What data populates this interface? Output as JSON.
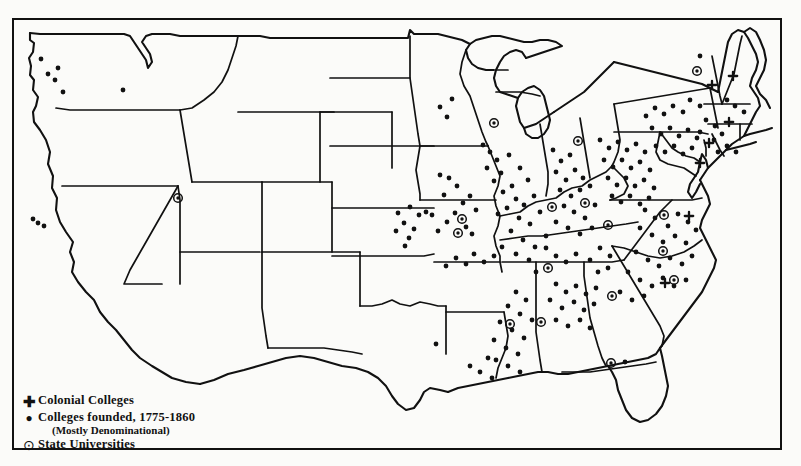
{
  "map": {
    "title": "Colleges and Universities Founded in the United States, 1775-1860",
    "background_color": "#fbfbf9",
    "ink_color": "#111111",
    "frame": true
  },
  "legend": {
    "items": [
      {
        "glyph": "plus-marker-icon",
        "symbol": "✚",
        "label": "Colonial Colleges",
        "sublabel": ""
      },
      {
        "glyph": "dot-marker-icon",
        "symbol": "•",
        "label": "Colleges founded, 1775-1860",
        "sublabel": "(Mostly Denominational)"
      },
      {
        "glyph": "circled-dot-marker-icon",
        "symbol": "⊙",
        "label": "State Universities",
        "sublabel": ""
      }
    ]
  },
  "chart_data": {
    "type": "scatter",
    "xlabel": "",
    "ylabel": "",
    "legend_position": "bottom-left",
    "grid": false,
    "series": [
      {
        "name": "Colonial Colleges",
        "marker": "plus",
        "count": 7,
        "points": [
          {
            "x": 712,
            "y": 85
          },
          {
            "x": 733,
            "y": 76
          },
          {
            "x": 729,
            "y": 122
          },
          {
            "x": 709,
            "y": 143
          },
          {
            "x": 700,
            "y": 163
          },
          {
            "x": 689,
            "y": 216
          },
          {
            "x": 665,
            "y": 283
          }
        ]
      },
      {
        "name": "State Universities",
        "marker": "circled-dot",
        "count": 16,
        "points": [
          {
            "x": 697,
            "y": 71
          },
          {
            "x": 674,
            "y": 280
          },
          {
            "x": 664,
            "y": 215
          },
          {
            "x": 663,
            "y": 251
          },
          {
            "x": 612,
            "y": 296
          },
          {
            "x": 608,
            "y": 225
          },
          {
            "x": 585,
            "y": 203
          },
          {
            "x": 578,
            "y": 141
          },
          {
            "x": 552,
            "y": 207
          },
          {
            "x": 548,
            "y": 268
          },
          {
            "x": 541,
            "y": 322
          },
          {
            "x": 510,
            "y": 324
          },
          {
            "x": 494,
            "y": 123
          },
          {
            "x": 462,
            "y": 219
          },
          {
            "x": 458,
            "y": 233
          },
          {
            "x": 611,
            "y": 363
          },
          {
            "x": 178,
            "y": 198
          }
        ]
      },
      {
        "name": "Colleges founded, 1775-1860 (Mostly Denominational)",
        "marker": "dot",
        "count": 210,
        "points": [
          {
            "x": 41,
            "y": 59
          },
          {
            "x": 48,
            "y": 74
          },
          {
            "x": 55,
            "y": 80
          },
          {
            "x": 58,
            "y": 68
          },
          {
            "x": 63,
            "y": 92
          },
          {
            "x": 123,
            "y": 90
          },
          {
            "x": 38,
            "y": 223
          },
          {
            "x": 44,
            "y": 226
          },
          {
            "x": 33,
            "y": 219
          },
          {
            "x": 440,
            "y": 107
          },
          {
            "x": 447,
            "y": 117
          },
          {
            "x": 452,
            "y": 99
          },
          {
            "x": 440,
            "y": 175
          },
          {
            "x": 449,
            "y": 178
          },
          {
            "x": 457,
            "y": 186
          },
          {
            "x": 444,
            "y": 195
          },
          {
            "x": 463,
            "y": 203
          },
          {
            "x": 470,
            "y": 196
          },
          {
            "x": 476,
            "y": 210
          },
          {
            "x": 455,
            "y": 213
          },
          {
            "x": 447,
            "y": 222
          },
          {
            "x": 466,
            "y": 227
          },
          {
            "x": 438,
            "y": 231
          },
          {
            "x": 472,
            "y": 234
          },
          {
            "x": 398,
            "y": 213
          },
          {
            "x": 404,
            "y": 223
          },
          {
            "x": 410,
            "y": 207
          },
          {
            "x": 396,
            "y": 231
          },
          {
            "x": 414,
            "y": 229
          },
          {
            "x": 405,
            "y": 246
          },
          {
            "x": 419,
            "y": 215
          },
          {
            "x": 409,
            "y": 238
          },
          {
            "x": 426,
            "y": 212
          },
          {
            "x": 432,
            "y": 215
          },
          {
            "x": 483,
            "y": 145
          },
          {
            "x": 490,
            "y": 152
          },
          {
            "x": 497,
            "y": 160
          },
          {
            "x": 487,
            "y": 168
          },
          {
            "x": 501,
            "y": 173
          },
          {
            "x": 509,
            "y": 155
          },
          {
            "x": 494,
            "y": 181
          },
          {
            "x": 512,
            "y": 186
          },
          {
            "x": 503,
            "y": 192
          },
          {
            "x": 520,
            "y": 168
          },
          {
            "x": 528,
            "y": 180
          },
          {
            "x": 516,
            "y": 199
          },
          {
            "x": 524,
            "y": 205
          },
          {
            "x": 534,
            "y": 196
          },
          {
            "x": 507,
            "y": 208
          },
          {
            "x": 498,
            "y": 214
          },
          {
            "x": 519,
            "y": 218
          },
          {
            "x": 530,
            "y": 224
          },
          {
            "x": 540,
            "y": 212
          },
          {
            "x": 511,
            "y": 231
          },
          {
            "x": 523,
            "y": 240
          },
          {
            "x": 535,
            "y": 247
          },
          {
            "x": 546,
            "y": 236
          },
          {
            "x": 502,
            "y": 247
          },
          {
            "x": 516,
            "y": 254
          },
          {
            "x": 529,
            "y": 260
          },
          {
            "x": 553,
            "y": 150
          },
          {
            "x": 561,
            "y": 161
          },
          {
            "x": 570,
            "y": 155
          },
          {
            "x": 556,
            "y": 172
          },
          {
            "x": 566,
            "y": 180
          },
          {
            "x": 575,
            "y": 170
          },
          {
            "x": 583,
            "y": 178
          },
          {
            "x": 560,
            "y": 190
          },
          {
            "x": 571,
            "y": 196
          },
          {
            "x": 580,
            "y": 190
          },
          {
            "x": 590,
            "y": 186
          },
          {
            "x": 564,
            "y": 206
          },
          {
            "x": 574,
            "y": 212
          },
          {
            "x": 585,
            "y": 218
          },
          {
            "x": 595,
            "y": 205
          },
          {
            "x": 556,
            "y": 222
          },
          {
            "x": 568,
            "y": 228
          },
          {
            "x": 580,
            "y": 234
          },
          {
            "x": 592,
            "y": 228
          },
          {
            "x": 600,
            "y": 140
          },
          {
            "x": 609,
            "y": 148
          },
          {
            "x": 618,
            "y": 142
          },
          {
            "x": 627,
            "y": 150
          },
          {
            "x": 636,
            "y": 144
          },
          {
            "x": 645,
            "y": 152
          },
          {
            "x": 604,
            "y": 160
          },
          {
            "x": 613,
            "y": 167
          },
          {
            "x": 622,
            "y": 160
          },
          {
            "x": 631,
            "y": 168
          },
          {
            "x": 640,
            "y": 162
          },
          {
            "x": 650,
            "y": 170
          },
          {
            "x": 608,
            "y": 178
          },
          {
            "x": 617,
            "y": 185
          },
          {
            "x": 626,
            "y": 178
          },
          {
            "x": 635,
            "y": 186
          },
          {
            "x": 644,
            "y": 180
          },
          {
            "x": 654,
            "y": 188
          },
          {
            "x": 612,
            "y": 196
          },
          {
            "x": 621,
            "y": 202
          },
          {
            "x": 630,
            "y": 196
          },
          {
            "x": 640,
            "y": 204
          },
          {
            "x": 649,
            "y": 198
          },
          {
            "x": 652,
            "y": 128
          },
          {
            "x": 661,
            "y": 134
          },
          {
            "x": 670,
            "y": 128
          },
          {
            "x": 679,
            "y": 136
          },
          {
            "x": 688,
            "y": 130
          },
          {
            "x": 697,
            "y": 138
          },
          {
            "x": 656,
            "y": 146
          },
          {
            "x": 665,
            "y": 152
          },
          {
            "x": 674,
            "y": 146
          },
          {
            "x": 683,
            "y": 154
          },
          {
            "x": 692,
            "y": 148
          },
          {
            "x": 706,
            "y": 120
          },
          {
            "x": 715,
            "y": 126
          },
          {
            "x": 700,
            "y": 132
          },
          {
            "x": 714,
            "y": 140
          },
          {
            "x": 722,
            "y": 134
          },
          {
            "x": 690,
            "y": 100
          },
          {
            "x": 700,
            "y": 106
          },
          {
            "x": 683,
            "y": 112
          },
          {
            "x": 673,
            "y": 106
          },
          {
            "x": 664,
            "y": 114
          },
          {
            "x": 655,
            "y": 108
          },
          {
            "x": 646,
            "y": 116
          },
          {
            "x": 700,
            "y": 56
          },
          {
            "x": 727,
            "y": 100
          },
          {
            "x": 735,
            "y": 106
          },
          {
            "x": 744,
            "y": 112
          },
          {
            "x": 718,
            "y": 152
          },
          {
            "x": 727,
            "y": 146
          },
          {
            "x": 736,
            "y": 152
          },
          {
            "x": 645,
            "y": 210
          },
          {
            "x": 655,
            "y": 218
          },
          {
            "x": 668,
            "y": 226
          },
          {
            "x": 678,
            "y": 214
          },
          {
            "x": 688,
            "y": 222
          },
          {
            "x": 640,
            "y": 228
          },
          {
            "x": 652,
            "y": 235
          },
          {
            "x": 663,
            "y": 242
          },
          {
            "x": 675,
            "y": 236
          },
          {
            "x": 686,
            "y": 243
          },
          {
            "x": 696,
            "y": 230
          },
          {
            "x": 636,
            "y": 252
          },
          {
            "x": 648,
            "y": 260
          },
          {
            "x": 659,
            "y": 266
          },
          {
            "x": 670,
            "y": 258
          },
          {
            "x": 682,
            "y": 264
          },
          {
            "x": 692,
            "y": 256
          },
          {
            "x": 628,
            "y": 272
          },
          {
            "x": 640,
            "y": 280
          },
          {
            "x": 652,
            "y": 286
          },
          {
            "x": 663,
            "y": 278
          },
          {
            "x": 674,
            "y": 286
          },
          {
            "x": 686,
            "y": 280
          },
          {
            "x": 620,
            "y": 292
          },
          {
            "x": 632,
            "y": 300
          },
          {
            "x": 644,
            "y": 296
          },
          {
            "x": 600,
            "y": 248
          },
          {
            "x": 610,
            "y": 256
          },
          {
            "x": 590,
            "y": 260
          },
          {
            "x": 598,
            "y": 272
          },
          {
            "x": 608,
            "y": 268
          },
          {
            "x": 556,
            "y": 284
          },
          {
            "x": 566,
            "y": 292
          },
          {
            "x": 576,
            "y": 286
          },
          {
            "x": 586,
            "y": 294
          },
          {
            "x": 596,
            "y": 288
          },
          {
            "x": 550,
            "y": 300
          },
          {
            "x": 562,
            "y": 308
          },
          {
            "x": 574,
            "y": 302
          },
          {
            "x": 584,
            "y": 310
          },
          {
            "x": 594,
            "y": 304
          },
          {
            "x": 556,
            "y": 320
          },
          {
            "x": 568,
            "y": 326
          },
          {
            "x": 580,
            "y": 320
          },
          {
            "x": 590,
            "y": 328
          },
          {
            "x": 516,
            "y": 292
          },
          {
            "x": 526,
            "y": 300
          },
          {
            "x": 508,
            "y": 306
          },
          {
            "x": 520,
            "y": 314
          },
          {
            "x": 532,
            "y": 320
          },
          {
            "x": 500,
            "y": 322
          },
          {
            "x": 512,
            "y": 330
          },
          {
            "x": 524,
            "y": 338
          },
          {
            "x": 494,
            "y": 340
          },
          {
            "x": 506,
            "y": 348
          },
          {
            "x": 518,
            "y": 354
          },
          {
            "x": 496,
            "y": 360
          },
          {
            "x": 508,
            "y": 366
          },
          {
            "x": 520,
            "y": 372
          },
          {
            "x": 488,
            "y": 358
          },
          {
            "x": 480,
            "y": 372
          },
          {
            "x": 492,
            "y": 378
          },
          {
            "x": 470,
            "y": 366
          },
          {
            "x": 436,
            "y": 344
          },
          {
            "x": 556,
            "y": 256
          },
          {
            "x": 566,
            "y": 262
          },
          {
            "x": 576,
            "y": 254
          },
          {
            "x": 546,
            "y": 248
          },
          {
            "x": 536,
            "y": 272
          },
          {
            "x": 625,
            "y": 362
          },
          {
            "x": 494,
            "y": 256
          },
          {
            "x": 484,
            "y": 262
          },
          {
            "x": 474,
            "y": 254
          },
          {
            "x": 466,
            "y": 264
          },
          {
            "x": 456,
            "y": 258
          },
          {
            "x": 446,
            "y": 266
          }
        ]
      }
    ]
  }
}
